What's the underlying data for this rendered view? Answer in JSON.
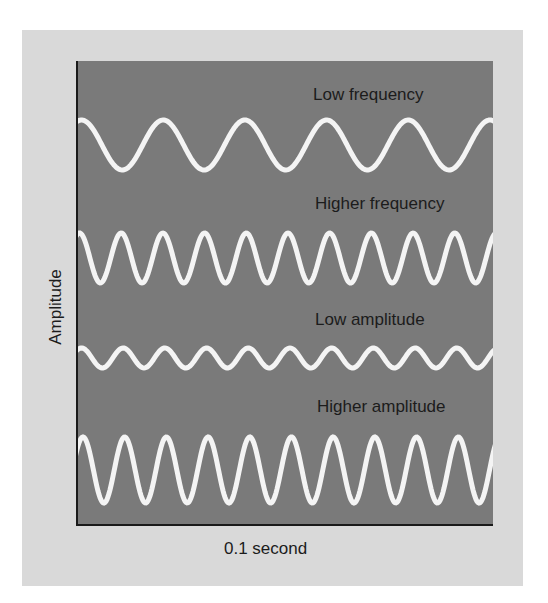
{
  "figure": {
    "x_axis_label": "0.1 second",
    "y_axis_label": "Amplitude",
    "colors": {
      "page_background": "#ffffff",
      "outer_panel": "#d9d9d9",
      "plot_background": "#7a7a7a",
      "axis_line": "#1a1a1a",
      "wave_stroke": "#f4f4f4",
      "text": "#1c1c1c"
    }
  },
  "waves": [
    {
      "label": "Low frequency",
      "label_pos": {
        "x": 313,
        "y": 86
      },
      "center_y": 145,
      "amplitude_px": 25,
      "period_px": 81.7,
      "first_peak_x": 79.5
    },
    {
      "label": "Higher frequency",
      "label_pos": {
        "x": 315,
        "y": 195
      },
      "center_y": 258,
      "amplitude_px": 25,
      "period_px": 41.7,
      "first_peak_x": 77.5
    },
    {
      "label": "Low amplitude",
      "label_pos": {
        "x": 315,
        "y": 311
      },
      "center_y": 358,
      "amplitude_px": 10,
      "period_px": 41.7,
      "first_peak_x": 79.5
    },
    {
      "label": "Higher amplitude",
      "label_pos": {
        "x": 317,
        "y": 398
      },
      "center_y": 470,
      "amplitude_px": 33,
      "period_px": 41.7,
      "first_peak_x": 81
    }
  ],
  "chart_data": {
    "type": "line",
    "title": "",
    "xlabel": "0.1 second",
    "ylabel": "Amplitude",
    "grid": false,
    "legend": "inline labels above each wave",
    "series": [
      {
        "name": "Low frequency",
        "cycles_in_window": 5.1,
        "relative_amplitude": 1.0
      },
      {
        "name": "Higher frequency",
        "cycles_in_window": 10.0,
        "relative_amplitude": 1.0
      },
      {
        "name": "Low amplitude",
        "cycles_in_window": 10.0,
        "relative_amplitude": 0.4
      },
      {
        "name": "Higher amplitude",
        "cycles_in_window": 10.0,
        "relative_amplitude": 1.3
      }
    ]
  }
}
